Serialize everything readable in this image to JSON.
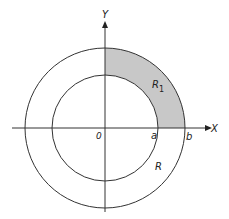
{
  "figure": {
    "axes": {
      "x_label": "X",
      "y_label": "Y",
      "origin_label": "0"
    },
    "points": {
      "a_label": "a",
      "b_label": "b"
    },
    "regions": {
      "r1_label": "R",
      "r1_subscript": "1",
      "r_label": "R"
    },
    "colors": {
      "line": "#333333",
      "shade": "#c8c8c8",
      "background": "#ffffff"
    }
  }
}
